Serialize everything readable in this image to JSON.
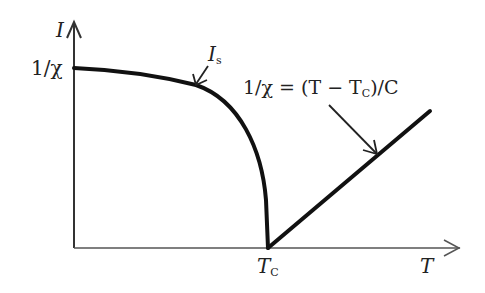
{
  "diagram": {
    "title": "",
    "axes": {
      "y_label": "I",
      "x_label": "T",
      "y_tick_label": "1/χ",
      "x_tick_label_main": "T",
      "x_tick_label_sub": "C"
    },
    "curves": [
      {
        "name": "spontaneous magnetization",
        "label_main": "I",
        "label_sub": "s"
      },
      {
        "name": "inverse susceptibility",
        "label": "1/χ = (T − T",
        "label_sub": "C",
        "label_tail": ")/C"
      }
    ],
    "colors": {
      "stroke": "#111111",
      "text": "#222222",
      "background": "#ffffff"
    }
  }
}
